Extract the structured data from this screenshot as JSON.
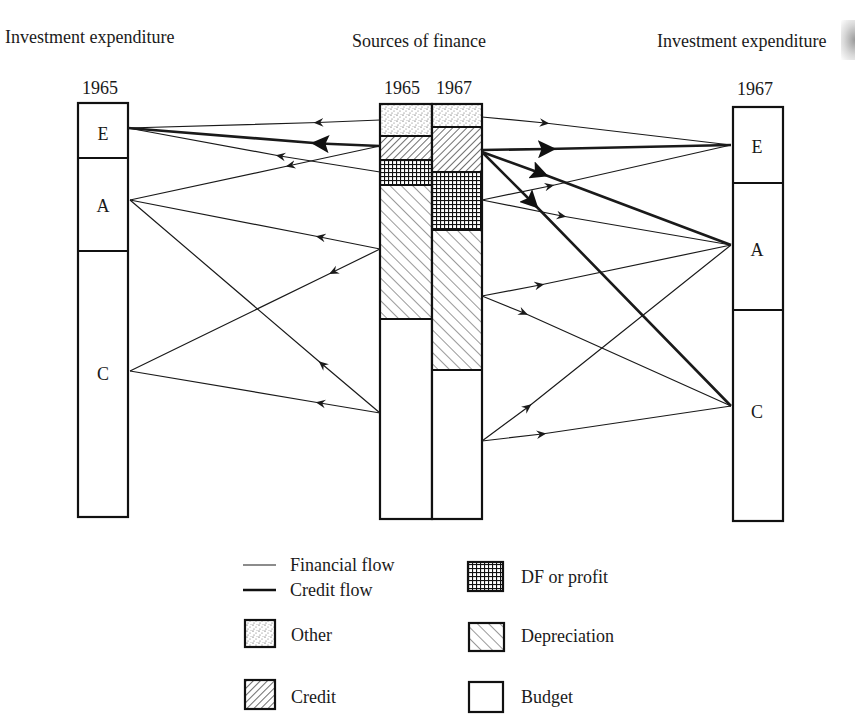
{
  "headings": {
    "left": "Investment expenditure",
    "center": "Sources of finance",
    "right": "Investment expenditure"
  },
  "years": {
    "left": "1965",
    "center_1965": "1965",
    "center_1967": "1967",
    "right": "1967"
  },
  "segment_labels": {
    "left_E": "E",
    "left_A": "A",
    "left_C": "C",
    "right_E": "E",
    "right_A": "A",
    "right_C": "C"
  },
  "legend": {
    "financial_flow": "Financial flow",
    "credit_flow": "Credit flow",
    "other": "Other",
    "credit": "Credit",
    "df_or_profit": "DF or profit",
    "depreciation": "Depreciation",
    "budget": "Budget"
  },
  "colors": {
    "ink": "#1a1a1a",
    "background": "#ffffff"
  },
  "diagram_data": {
    "type": "flow",
    "investment_1965": {
      "E": 0.13,
      "A": 0.23,
      "C": 0.64
    },
    "investment_1967": {
      "E": 0.18,
      "A": 0.31,
      "C": 0.51
    },
    "sources_1965": {
      "Other": 0.08,
      "Credit": 0.06,
      "DF or profit": 0.06,
      "Depreciation": 0.32,
      "Budget": 0.48
    },
    "sources_1967": {
      "Other": 0.06,
      "Credit": 0.11,
      "DF or profit": 0.14,
      "Depreciation": 0.34,
      "Budget": 0.35
    },
    "flows_1965": [
      {
        "from": "Other",
        "to": "E",
        "kind": "financial"
      },
      {
        "from": "Credit",
        "to": "E",
        "kind": "credit"
      },
      {
        "from": "DF or profit",
        "to": "E",
        "kind": "financial"
      },
      {
        "from": "Credit",
        "to": "A",
        "kind": "financial"
      },
      {
        "from": "Depreciation",
        "to": "A",
        "kind": "financial"
      },
      {
        "from": "Depreciation",
        "to": "C",
        "kind": "financial"
      },
      {
        "from": "Budget",
        "to": "A",
        "kind": "financial"
      },
      {
        "from": "Budget",
        "to": "C",
        "kind": "financial"
      }
    ],
    "flows_1967": [
      {
        "from": "Other",
        "to": "E",
        "kind": "financial"
      },
      {
        "from": "Credit",
        "to": "E",
        "kind": "credit"
      },
      {
        "from": "Credit",
        "to": "A",
        "kind": "credit"
      },
      {
        "from": "Credit",
        "to": "C",
        "kind": "credit"
      },
      {
        "from": "DF or profit",
        "to": "E",
        "kind": "financial"
      },
      {
        "from": "DF or profit",
        "to": "A",
        "kind": "financial"
      },
      {
        "from": "Depreciation",
        "to": "A",
        "kind": "financial"
      },
      {
        "from": "Depreciation",
        "to": "C",
        "kind": "financial"
      },
      {
        "from": "Budget",
        "to": "A",
        "kind": "financial"
      },
      {
        "from": "Budget",
        "to": "C",
        "kind": "financial"
      }
    ]
  }
}
